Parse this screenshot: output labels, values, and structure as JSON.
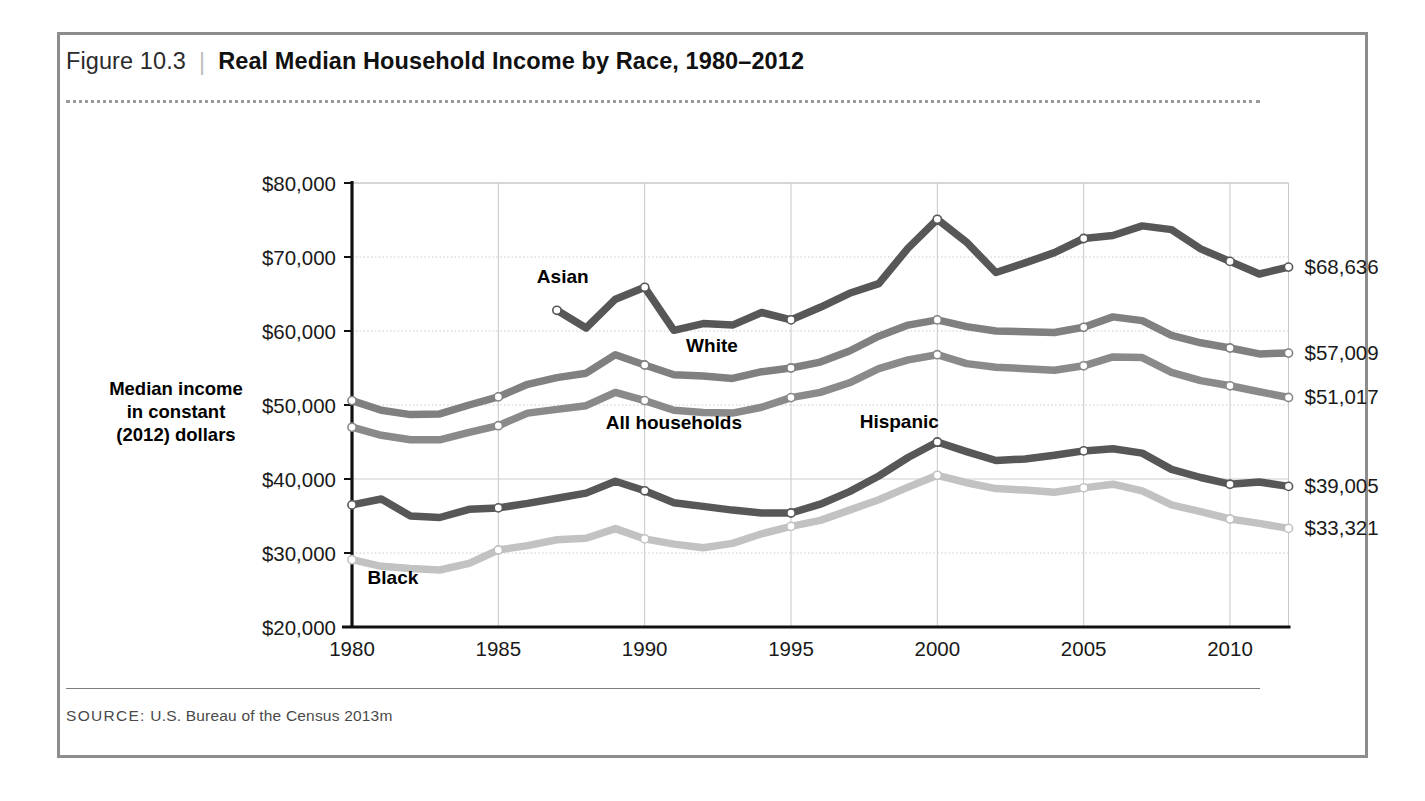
{
  "figure": {
    "number": "Figure 10.3",
    "separator": "|",
    "title": "Real Median Household Income by Race, 1980–2012",
    "source_label": "SOURCE:",
    "source_text": "U.S. Bureau of the Census 2013m"
  },
  "chart_data": {
    "type": "line",
    "title": "Real Median Household Income by Race, 1980–2012",
    "xlabel": "",
    "ylabel": "Median income in constant (2012) dollars",
    "ylabel_lines": [
      "Median income",
      "in constant",
      "(2012) dollars"
    ],
    "xlim": [
      1980,
      2012
    ],
    "ylim": [
      20000,
      80000
    ],
    "grid": true,
    "legend_position": "inline-annotations",
    "ytick_labels": [
      "$80,000",
      "$70,000",
      "$60,000",
      "$50,000",
      "$40,000",
      "$30,000",
      "$20,000"
    ],
    "ytick_values": [
      80000,
      70000,
      60000,
      50000,
      40000,
      30000,
      20000
    ],
    "xtick_labels": [
      "1980",
      "1985",
      "1990",
      "1995",
      "2000",
      "2005",
      "2010"
    ],
    "xtick_values": [
      1980,
      1985,
      1990,
      1995,
      2000,
      2005,
      2010
    ],
    "x": [
      1980,
      1981,
      1982,
      1983,
      1984,
      1985,
      1986,
      1987,
      1988,
      1989,
      1990,
      1991,
      1992,
      1993,
      1994,
      1995,
      1996,
      1997,
      1998,
      1999,
      2000,
      2001,
      2002,
      2003,
      2004,
      2005,
      2006,
      2007,
      2008,
      2009,
      2010,
      2011,
      2012
    ],
    "series": [
      {
        "name": "Asian",
        "color": "#575757",
        "end_label": "$68,636",
        "label_x": 1987.2,
        "label_y": 66500,
        "start_year": 1987,
        "values": [
          null,
          null,
          null,
          null,
          null,
          null,
          null,
          62800,
          60400,
          64300,
          65900,
          60100,
          61000,
          60800,
          62500,
          61500,
          63200,
          65100,
          66400,
          71200,
          75100,
          72000,
          67900,
          69200,
          70600,
          72500,
          72900,
          74200,
          73700,
          71100,
          69400,
          67700,
          68636
        ]
      },
      {
        "name": "White",
        "color": "#808080",
        "end_label": "$57,009",
        "label_x": 1992.3,
        "label_y": 57200,
        "start_year": 1980,
        "values": [
          50600,
          49300,
          48700,
          48800,
          50000,
          51100,
          52800,
          53700,
          54300,
          56800,
          55400,
          54100,
          53900,
          53600,
          54500,
          55000,
          55800,
          57300,
          59300,
          60800,
          61500,
          60600,
          60000,
          59900,
          59800,
          60500,
          61900,
          61400,
          59400,
          58400,
          57700,
          56900,
          57009
        ]
      },
      {
        "name": "All households",
        "color": "#8a8a8a",
        "end_label": "$51,017",
        "label_x": 1991.0,
        "label_y": 46700,
        "start_year": 1980,
        "values": [
          47000,
          45900,
          45300,
          45300,
          46300,
          47200,
          48900,
          49400,
          49900,
          51700,
          50600,
          49300,
          49000,
          48900,
          49700,
          51000,
          51700,
          53000,
          54900,
          56100,
          56800,
          55600,
          55100,
          54900,
          54700,
          55300,
          56500,
          56400,
          54400,
          53300,
          52600,
          51800,
          51017
        ]
      },
      {
        "name": "Hispanic",
        "color": "#575757",
        "end_label": "$39,005",
        "label_x": 1998.7,
        "label_y": 46900,
        "start_year": 1980,
        "values": [
          36500,
          37300,
          35000,
          34800,
          35900,
          36100,
          36700,
          37400,
          38100,
          39700,
          38400,
          36800,
          36300,
          35800,
          35400,
          35400,
          36600,
          38300,
          40400,
          42900,
          45000,
          43700,
          42500,
          42700,
          43200,
          43800,
          44100,
          43500,
          41300,
          40200,
          39300,
          39600,
          39005
        ]
      },
      {
        "name": "Black",
        "color": "#c2c2c2",
        "end_label": "$33,321",
        "label_x": 1981.4,
        "label_y": 25800,
        "start_year": 1980,
        "values": [
          29100,
          28200,
          27900,
          27700,
          28600,
          30400,
          31000,
          31800,
          32000,
          33300,
          31900,
          31200,
          30700,
          31300,
          32600,
          33600,
          34400,
          35800,
          37200,
          38900,
          40500,
          39500,
          38700,
          38500,
          38200,
          38800,
          39300,
          38400,
          36500,
          35600,
          34600,
          34000,
          33321
        ]
      }
    ]
  }
}
